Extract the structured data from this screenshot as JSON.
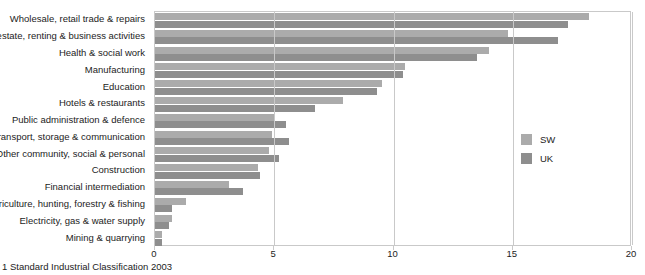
{
  "header_fragment": "",
  "footnote": "1 Standard Industrial Classification 2003",
  "legend": {
    "position": "right-middle",
    "items": [
      {
        "label": "SW",
        "color": "#ababab"
      },
      {
        "label": "UK",
        "color": "#8e8e8e"
      }
    ]
  },
  "axis": {
    "ticks": [
      "0",
      "5",
      "10",
      "15",
      "20"
    ],
    "tick_values": [
      0,
      5,
      10,
      15,
      20
    ]
  },
  "chart_data": {
    "type": "bar",
    "orientation": "horizontal",
    "title": "",
    "subtitle": "",
    "xlabel": "",
    "ylabel": "",
    "xlim": [
      0,
      20
    ],
    "grid": true,
    "legend_position": "right",
    "categories": [
      "Wholesale, retail trade & repairs",
      "Real estate, renting & business activities",
      "Health & social work",
      "Manufacturing",
      "Education",
      "Hotels & restaurants",
      "Public administration & defence",
      "Transport, storage & communication",
      "Other community, social & personal",
      "Construction",
      "Financial intermediation",
      "Agriculture, hunting, forestry & fishing",
      "Electricity, gas & water supply",
      "Mining & quarrying"
    ],
    "series": [
      {
        "name": "SW",
        "color": "#ababab",
        "values": [
          18.2,
          14.8,
          14.0,
          10.5,
          9.5,
          7.9,
          5.0,
          4.9,
          4.8,
          4.3,
          3.1,
          1.3,
          0.7,
          0.3
        ]
      },
      {
        "name": "UK",
        "color": "#8e8e8e",
        "values": [
          17.3,
          16.9,
          13.5,
          10.4,
          9.3,
          6.7,
          5.5,
          5.6,
          5.2,
          4.4,
          3.7,
          0.7,
          0.6,
          0.3
        ]
      }
    ]
  }
}
